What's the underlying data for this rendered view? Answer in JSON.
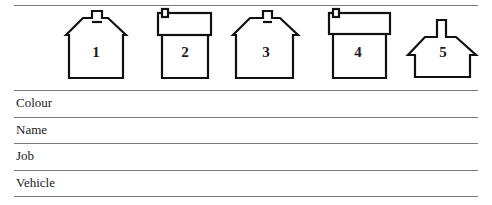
{
  "houses": [
    {
      "number": "1",
      "style": "gabled-roof-center-chimney"
    },
    {
      "number": "2",
      "style": "flat-roof-corner-chimney"
    },
    {
      "number": "3",
      "style": "gabled-roof-center-chimney"
    },
    {
      "number": "4",
      "style": "flat-roof-corner-chimney"
    },
    {
      "number": "5",
      "style": "gabled-roof-tall-chimney"
    }
  ],
  "rows": [
    {
      "label": "Colour"
    },
    {
      "label": "Name"
    },
    {
      "label": "Job"
    },
    {
      "label": "Vehicle"
    }
  ]
}
